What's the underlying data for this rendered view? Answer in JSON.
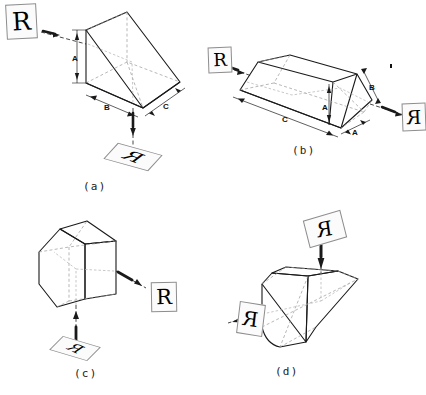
{
  "figure": {
    "background_color": "#ffffff",
    "line_color": "#1a1a1a",
    "hidden_line_color": "#9a9a9a",
    "panels": [
      {
        "id": "a",
        "caption": "(a)",
        "prism_name": "right-angle-prism",
        "dimensions": [
          {
            "label": "A",
            "orientation": "vertical",
            "edge": "entrance-face-height"
          },
          {
            "label": "B",
            "orientation": "horizontal",
            "edge": "bottom-face-length"
          },
          {
            "label": "C",
            "orientation": "oblique",
            "edge": "bottom-face-depth"
          }
        ],
        "rays": [
          {
            "from": "left",
            "to": "prism",
            "image_tile": "R",
            "tile_state": "upright"
          },
          {
            "from": "prism",
            "to": "bottom",
            "image_tile": "R",
            "tile_state": "rotated-mirrored"
          }
        ]
      },
      {
        "id": "b",
        "caption": "(b)",
        "prism_name": "dove-prism",
        "dimensions": [
          {
            "label": "A",
            "orientation": "vertical",
            "edge": "prism-height"
          },
          {
            "label": "A",
            "orientation": "oblique",
            "edge": "end-face-width"
          },
          {
            "label": "B",
            "orientation": "oblique",
            "edge": "slanted-end-face"
          },
          {
            "label": "C",
            "orientation": "oblique",
            "edge": "long-base-length"
          }
        ],
        "rays": [
          {
            "from": "left",
            "to": "prism",
            "image_tile": "R",
            "tile_state": "upright"
          },
          {
            "from": "prism",
            "to": "right",
            "image_tile": "R",
            "tile_state": "mirrored"
          }
        ]
      },
      {
        "id": "c",
        "caption": "(c)",
        "prism_name": "pentaprism",
        "dimensions": [],
        "rays": [
          {
            "from": "bottom",
            "to": "prism",
            "image_tile": "R",
            "tile_state": "rotated-mirrored"
          },
          {
            "from": "prism",
            "to": "right",
            "image_tile": "R",
            "tile_state": "upright"
          }
        ]
      },
      {
        "id": "d",
        "caption": "(d)",
        "prism_name": "amici-roof-prism",
        "dimensions": [],
        "rays": [
          {
            "from": "top",
            "to": "prism",
            "image_tile": "R",
            "tile_state": "rotated-mirrored"
          },
          {
            "from": "prism",
            "to": "left",
            "image_tile": "R",
            "tile_state": "mirrored"
          }
        ]
      }
    ],
    "image_tiles": {
      "a_in": "R",
      "a_out": "R",
      "b_in": "R",
      "b_out": "R",
      "c_in": "R",
      "c_out": "R",
      "d_in": "R",
      "d_out": "R"
    },
    "dimension_labels": {
      "a_A": "A",
      "a_B": "B",
      "a_C": "C",
      "b_A_vert": "A",
      "b_A_base": "A",
      "b_B": "B",
      "b_C": "C"
    },
    "captions": {
      "a": "(a)",
      "b": "(b)",
      "c": "(c)",
      "d": "(d)"
    }
  }
}
